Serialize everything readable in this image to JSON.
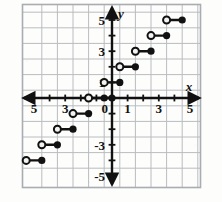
{
  "figure": {
    "kind": "coordinate-plane-step-function",
    "axis_labels": {
      "x": "x",
      "y": "y"
    },
    "origin_label": "0"
  },
  "chart_data": {
    "type": "line",
    "title": "",
    "xlabel": "x",
    "ylabel": "y",
    "xlim": [
      -5.8,
      5.8
    ],
    "ylim": [
      -5.8,
      5.8
    ],
    "grid": true,
    "legend": "none",
    "x_tick_labels": [
      "5",
      "3",
      "0",
      "1",
      "3",
      "5"
    ],
    "x_tick_values": [
      -5,
      -3,
      0,
      1,
      3,
      5
    ],
    "y_tick_labels": [
      "5",
      "3",
      "1",
      "0",
      "-3",
      "-5"
    ],
    "y_tick_values": [
      5,
      3,
      1,
      0,
      -3,
      -5
    ],
    "x_ticks_all": [
      -5,
      -4,
      -3,
      -2,
      -1,
      0,
      1,
      2,
      3,
      4,
      5
    ],
    "y_ticks_all": [
      -5,
      -4,
      -3,
      -2,
      -1,
      0,
      1,
      2,
      3,
      4,
      5
    ],
    "steps": [
      {
        "y": -4,
        "x_open": -5.5,
        "x_closed": -4.5
      },
      {
        "y": -3,
        "x_open": -4.5,
        "x_closed": -3.5
      },
      {
        "y": -2,
        "x_open": -3.5,
        "x_closed": -2.5
      },
      {
        "y": -1,
        "x_open": -2.5,
        "x_closed": -1.5
      },
      {
        "y": 0,
        "x_open": -1.5,
        "x_closed": -0.5
      },
      {
        "y": 0,
        "x_open": -0.5,
        "x_closed": 0
      },
      {
        "y": 1,
        "x_open": -0.5,
        "x_closed": 0.5
      },
      {
        "y": 2,
        "x_open": 0.5,
        "x_closed": 1.5
      },
      {
        "y": 3,
        "x_open": 1.5,
        "x_closed": 2.5
      },
      {
        "y": 4,
        "x_open": 2.5,
        "x_closed": 3.5
      },
      {
        "y": 5,
        "x_open": 3.5,
        "x_closed": 4.5
      }
    ],
    "open_points": [
      {
        "x": -5.5,
        "y": -4
      },
      {
        "x": -4.5,
        "y": -3
      },
      {
        "x": -3.5,
        "y": -2
      },
      {
        "x": -2.5,
        "y": -1
      },
      {
        "x": -1.5,
        "y": 0
      },
      {
        "x": -0.5,
        "y": 1
      },
      {
        "x": 0.5,
        "y": 2
      },
      {
        "x": 1.5,
        "y": 3
      },
      {
        "x": 2.5,
        "y": 4
      },
      {
        "x": 3.5,
        "y": 5
      }
    ],
    "closed_points": [
      {
        "x": -4.5,
        "y": -4
      },
      {
        "x": -3.5,
        "y": -3
      },
      {
        "x": -2.5,
        "y": -2
      },
      {
        "x": -1.5,
        "y": -1
      },
      {
        "x": -0.5,
        "y": 0
      },
      {
        "x": 0,
        "y": 0
      },
      {
        "x": 0.5,
        "y": 1
      },
      {
        "x": 1.5,
        "y": 2
      },
      {
        "x": 2.5,
        "y": 3
      },
      {
        "x": 3.5,
        "y": 4
      },
      {
        "x": 4.5,
        "y": 5
      }
    ]
  },
  "style": {
    "grid_color": "#b9bcc0",
    "frame_color": "#a9acb0",
    "axis_color": "#111111",
    "curve_color": "#111111",
    "open_fill": "#f2f2f0",
    "background": "#fdfdfc",
    "label_color": "#111111"
  }
}
